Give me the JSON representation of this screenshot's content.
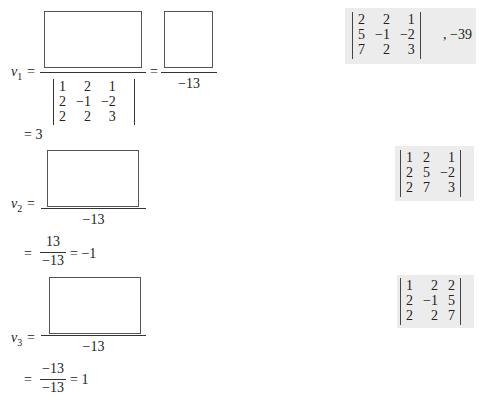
{
  "v1": {
    "label": "v",
    "subscript": "1",
    "equals": "=",
    "denominator_matrix": [
      [
        "1",
        "2",
        "1"
      ],
      [
        "2",
        "−1",
        "−2"
      ],
      [
        "2",
        "2",
        "3"
      ]
    ],
    "second_denominator": "−13",
    "result": "= 3"
  },
  "v2": {
    "label": "v",
    "subscript": "2",
    "equals": "=",
    "denominator": "−13",
    "step_equals": "=",
    "step_numerator": "13",
    "step_denominator": "−13",
    "result": "= −1"
  },
  "v3": {
    "label": "v",
    "subscript": "3",
    "equals": "=",
    "denominator": "−13",
    "step_equals": "=",
    "step_numerator": "−13",
    "step_denominator": "−13",
    "result": "= 1"
  },
  "answers": {
    "answer1_matrix": [
      [
        "2",
        "2",
        "1"
      ],
      [
        "5",
        "−1",
        "−2"
      ],
      [
        "7",
        "2",
        "3"
      ]
    ],
    "answer1_suffix": ", −39",
    "answer2_matrix": [
      [
        "1",
        "2",
        "1"
      ],
      [
        "2",
        "5",
        "−2"
      ],
      [
        "2",
        "7",
        "3"
      ]
    ],
    "answer3_matrix": [
      [
        "1",
        "2",
        "2"
      ],
      [
        "2",
        "−1",
        "5"
      ],
      [
        "2",
        "2",
        "7"
      ]
    ]
  }
}
